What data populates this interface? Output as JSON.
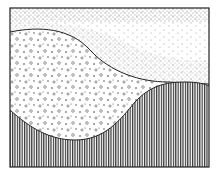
{
  "illustration": {
    "description": "Black-and-white stippled cross-section drawing with three layers",
    "colors": {
      "ink": "#222222",
      "paper": "#ffffff"
    },
    "layers": [
      {
        "name": "fine-stipple-top",
        "pattern": "fine dots"
      },
      {
        "name": "coarse-grain-middle",
        "pattern": "circles and dots"
      },
      {
        "name": "vertical-hatch-bottom",
        "pattern": "vertical lines"
      }
    ]
  }
}
